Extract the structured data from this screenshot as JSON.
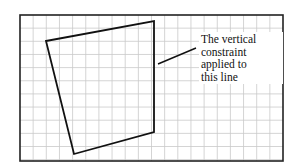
{
  "diagram": {
    "type": "sketch-on-grid",
    "frame": {
      "x": 20,
      "y": 15,
      "width": 263,
      "height": 146
    },
    "grid": {
      "spacing": 13.15,
      "color": "#c8c8c8"
    },
    "shape": {
      "name": "quadrilateral",
      "vertices": [
        [
          46,
          41
        ],
        [
          154,
          21
        ],
        [
          154,
          132
        ],
        [
          74,
          154
        ]
      ],
      "stroke": "#111111"
    },
    "leader": {
      "from": [
        158,
        64
      ],
      "to": [
        196,
        48
      ]
    },
    "annotation": {
      "lines": [
        "The vertical",
        "constraint",
        "applied to",
        "this line"
      ]
    }
  }
}
